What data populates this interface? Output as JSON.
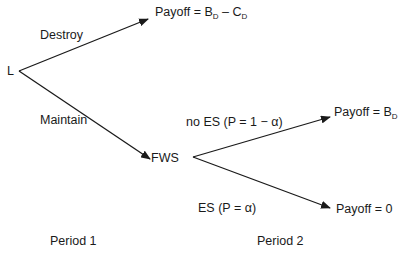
{
  "diagram": {
    "type": "decision-tree",
    "nodes": {
      "root": "L",
      "fws": "FWS"
    },
    "edges": {
      "destroy": "Destroy",
      "maintain": "Maintain",
      "no_es": "no ES (P = 1 − α)",
      "es": "ES (P = α)"
    },
    "payoffs": {
      "destroy": {
        "prefix": "Payoff = B",
        "sub1": "D",
        "mid": " – C",
        "sub2": "D"
      },
      "no_es": {
        "prefix": "Payoff = B",
        "sub1": "D"
      },
      "es": "Payoff = 0"
    },
    "periods": {
      "p1": "Period 1",
      "p2": "Period 2"
    },
    "colors": {
      "line": "#1a1a1a",
      "background": "#ffffff"
    }
  }
}
